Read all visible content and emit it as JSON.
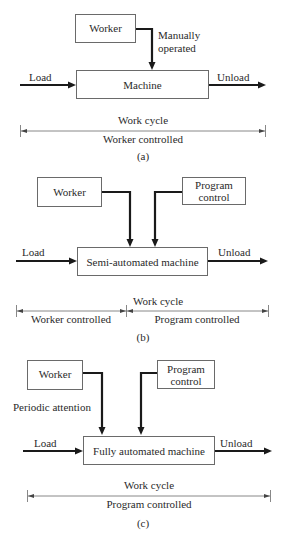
{
  "diagram": {
    "panel_a": {
      "caption": "(a)",
      "worker_box": "Worker",
      "worker_link_label_line1": "Manually",
      "worker_link_label_line2": "operated",
      "machine_box": "Machine",
      "input_label": "Load",
      "output_label": "Unload",
      "cycle_label": "Work cycle",
      "segments": [
        "Worker controlled"
      ]
    },
    "panel_b": {
      "caption": "(b)",
      "worker_box": "Worker",
      "program_box_line1": "Program",
      "program_box_line2": "control",
      "machine_box": "Semi-automated machine",
      "input_label": "Load",
      "output_label": "Unload",
      "cycle_label": "Work cycle",
      "segments": [
        "Worker controlled",
        "Program controlled"
      ]
    },
    "panel_c": {
      "caption": "(c)",
      "worker_box": "Worker",
      "worker_link_label": "Periodic attention",
      "program_box_line1": "Program",
      "program_box_line2": "control",
      "machine_box": "Fully automated machine",
      "input_label": "Load",
      "output_label": "Unload",
      "cycle_label": "Work cycle",
      "segments": [
        "Program controlled"
      ]
    }
  }
}
